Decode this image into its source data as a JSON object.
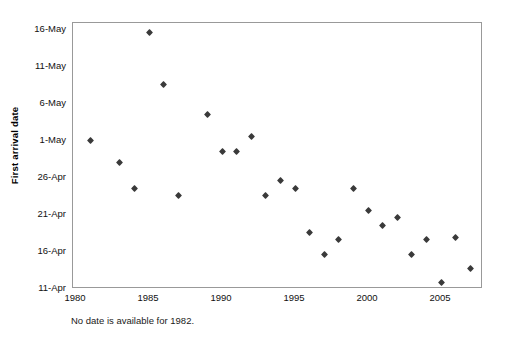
{
  "chart_data": {
    "type": "scatter",
    "title": "",
    "subtitle": "",
    "xlabel": "",
    "ylabel": "First arrival date",
    "caption": "No date is available for 1982.",
    "grid": false,
    "legend": null,
    "xlim": [
      1980,
      2007.6
    ],
    "ylim_labels": [
      "11-Apr",
      "16-May"
    ],
    "xticks": [
      "1980",
      "1985",
      "1990",
      "1995",
      "2000",
      "2005"
    ],
    "xtick_values": [
      1980,
      1985,
      1990,
      1995,
      2000,
      2005
    ],
    "yticks": [
      "11-Apr",
      "16-Apr",
      "21-Apr",
      "26-Apr",
      "1-May",
      "6-May",
      "11-May",
      "16-May"
    ],
    "ytick_values": [
      11,
      16,
      21,
      26,
      31,
      36,
      41,
      46
    ],
    "marker": "diamond",
    "marker_color": "#3a3a3a",
    "points": [
      {
        "x": 1981,
        "y": 31,
        "date": "1-May"
      },
      {
        "x": 1983,
        "y": 28,
        "date": "28-Apr"
      },
      {
        "x": 1984,
        "y": 24.5,
        "date": "25-Apr"
      },
      {
        "x": 1985,
        "y": 45.5,
        "date": "16-May"
      },
      {
        "x": 1986,
        "y": 38.5,
        "date": "9-May"
      },
      {
        "x": 1987,
        "y": 23.5,
        "date": "24-Apr"
      },
      {
        "x": 1989,
        "y": 34.5,
        "date": "5-May"
      },
      {
        "x": 1990,
        "y": 29.5,
        "date": "30-Apr"
      },
      {
        "x": 1991,
        "y": 29.5,
        "date": "30-Apr"
      },
      {
        "x": 1992,
        "y": 31.5,
        "date": "2-May"
      },
      {
        "x": 1993,
        "y": 23.5,
        "date": "24-Apr"
      },
      {
        "x": 1994,
        "y": 25.5,
        "date": "26-Apr"
      },
      {
        "x": 1995,
        "y": 24.5,
        "date": "25-Apr"
      },
      {
        "x": 1996,
        "y": 18.5,
        "date": "19-Apr"
      },
      {
        "x": 1997,
        "y": 15.5,
        "date": "16-Apr"
      },
      {
        "x": 1998,
        "y": 17.5,
        "date": "18-Apr"
      },
      {
        "x": 1999,
        "y": 24.5,
        "date": "25-Apr"
      },
      {
        "x": 2000,
        "y": 21.5,
        "date": "22-Apr"
      },
      {
        "x": 2001,
        "y": 19.5,
        "date": "20-Apr"
      },
      {
        "x": 2002,
        "y": 20.5,
        "date": "21-Apr"
      },
      {
        "x": 2003,
        "y": 15.5,
        "date": "16-Apr"
      },
      {
        "x": 2004,
        "y": 17.5,
        "date": "18-Apr"
      },
      {
        "x": 2005,
        "y": 11.8,
        "date": "12-Apr"
      },
      {
        "x": 2006,
        "y": 17.8,
        "date": "18-Apr"
      },
      {
        "x": 2007,
        "y": 13.7,
        "date": "14-Apr"
      }
    ]
  },
  "axes": {
    "y_title": "First arrival date"
  },
  "notes": {
    "caption": "No date is available for 1982."
  }
}
